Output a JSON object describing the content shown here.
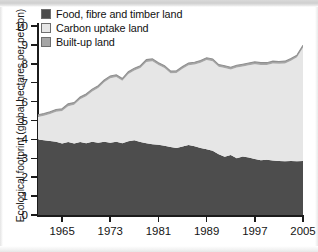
{
  "chart_data": {
    "type": "area",
    "stacked": true,
    "title": "",
    "xlabel": "",
    "ylabel": "Ecological footprint (global hectares per person)",
    "ylim": [
      0,
      10
    ],
    "xlim": [
      1961,
      2005
    ],
    "yticks": [
      0,
      1,
      2,
      3,
      4,
      5,
      6,
      7,
      8,
      9,
      10
    ],
    "xticks": [
      1965,
      1973,
      1981,
      1989,
      1997,
      2005
    ],
    "grid": false,
    "legend_position": "top-left",
    "x": [
      1961,
      1962,
      1963,
      1964,
      1965,
      1966,
      1967,
      1968,
      1969,
      1970,
      1971,
      1972,
      1973,
      1974,
      1975,
      1976,
      1977,
      1978,
      1979,
      1980,
      1981,
      1982,
      1983,
      1984,
      1985,
      1986,
      1987,
      1988,
      1989,
      1990,
      1991,
      1992,
      1993,
      1994,
      1995,
      1996,
      1997,
      1998,
      1999,
      2000,
      2001,
      2002,
      2003,
      2004,
      2005
    ],
    "series": [
      {
        "name": "Food, fibre and timber land",
        "color": "#4d4d4d",
        "values": [
          4.0,
          3.95,
          3.92,
          3.88,
          3.78,
          3.86,
          3.78,
          3.86,
          3.8,
          3.88,
          3.82,
          3.88,
          3.82,
          3.88,
          3.8,
          3.9,
          3.95,
          3.86,
          3.8,
          3.74,
          3.72,
          3.66,
          3.6,
          3.55,
          3.62,
          3.7,
          3.64,
          3.55,
          3.48,
          3.4,
          3.22,
          3.08,
          3.18,
          3.0,
          3.1,
          3.04,
          2.96,
          2.9,
          2.92,
          2.88,
          2.86,
          2.84,
          2.86,
          2.84,
          2.86
        ]
      },
      {
        "name": "Carbon uptake land",
        "color": "#e6e6e6",
        "values": [
          1.18,
          1.3,
          1.42,
          1.58,
          1.72,
          1.9,
          2.05,
          2.26,
          2.48,
          2.66,
          2.9,
          3.14,
          3.42,
          3.42,
          3.3,
          3.56,
          3.7,
          3.92,
          4.3,
          4.4,
          4.22,
          4.12,
          3.9,
          3.96,
          4.12,
          4.22,
          4.32,
          4.5,
          4.72,
          4.74,
          4.62,
          4.7,
          4.52,
          4.8,
          4.76,
          4.88,
          5.02,
          5.04,
          5.02,
          5.14,
          5.14,
          5.18,
          5.3,
          5.5,
          6.0
        ]
      },
      {
        "name": "Built-up land",
        "color": "#a6a6a6",
        "values": [
          0.12,
          0.12,
          0.12,
          0.12,
          0.12,
          0.12,
          0.12,
          0.12,
          0.12,
          0.12,
          0.12,
          0.12,
          0.12,
          0.12,
          0.12,
          0.12,
          0.12,
          0.12,
          0.12,
          0.12,
          0.12,
          0.12,
          0.12,
          0.12,
          0.12,
          0.12,
          0.12,
          0.12,
          0.12,
          0.12,
          0.12,
          0.12,
          0.12,
          0.12,
          0.12,
          0.12,
          0.12,
          0.12,
          0.12,
          0.12,
          0.12,
          0.12,
          0.12,
          0.12,
          0.12
        ]
      }
    ],
    "totals": [
      5.3,
      5.37,
      5.46,
      5.58,
      5.62,
      5.88,
      5.95,
      6.24,
      6.4,
      6.66,
      6.84,
      7.14,
      7.36,
      7.42,
      7.22,
      7.58,
      7.77,
      7.9,
      8.22,
      8.26,
      8.06,
      7.9,
      7.62,
      7.63,
      7.86,
      8.04,
      8.08,
      8.17,
      8.32,
      8.26,
      7.96,
      7.9,
      7.82,
      7.92,
      7.98,
      8.04,
      8.1,
      8.06,
      8.06,
      8.14,
      8.12,
      8.14,
      8.28,
      8.46,
      8.98
    ]
  },
  "legend": {
    "items": [
      {
        "label": "Food, fibre and timber land",
        "color": "#4d4d4d"
      },
      {
        "label": "Carbon uptake land",
        "color": "#e6e6e6"
      },
      {
        "label": "Built-up land",
        "color": "#a6a6a6"
      }
    ]
  },
  "axes": {
    "y_title": "Ecological footprint (global hectares per person)",
    "y_labels": [
      "10",
      "9",
      "8",
      "7",
      "6",
      "5",
      "4",
      "3",
      "2",
      "1",
      "0"
    ],
    "x_labels": [
      "1965",
      "1973",
      "1981",
      "1989",
      "1997",
      "2005"
    ]
  }
}
